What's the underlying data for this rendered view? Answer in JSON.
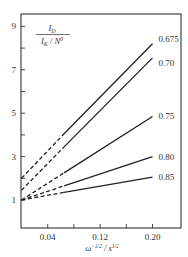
{
  "chart_data": {
    "type": "line",
    "title": "",
    "xlabel": "ω^{-1/2} / s^{1/2}",
    "xlabel_parts": {
      "base": "ω",
      "exp": "−1/2",
      "sep": " / s",
      "unit_exp": "1/2"
    },
    "ylabel": "I_D / (I_K / N^0)",
    "ylabel_parts": {
      "num": "I",
      "num_sub": "D",
      "den": "I",
      "den_sub": "K",
      "den_sep": " / N",
      "den_sup": "0"
    },
    "xlim": [
      0.0,
      0.24
    ],
    "ylim": [
      0,
      9.6
    ],
    "x_ticks": [
      0.04,
      0.08,
      0.12,
      0.16,
      0.2
    ],
    "x_tick_labels": [
      "0.04",
      "",
      "0.12",
      "",
      "0.20"
    ],
    "y_ticks": [
      1,
      2,
      3,
      4,
      5,
      6,
      7,
      8,
      9
    ],
    "y_tick_labels": [
      "1",
      "",
      "3",
      "",
      "5",
      "",
      "7",
      "",
      "9"
    ],
    "grid": false,
    "legend": "inline labels at right end of each line",
    "extrapolation_note": "dashed segments extrapolate to x = 0; solid segments are measured range",
    "series": [
      {
        "name": "0.675",
        "x": [
          0.0,
          0.065,
          0.2
        ],
        "y": [
          2.0,
          4.05,
          8.2
        ],
        "solid_from_x": 0.065
      },
      {
        "name": "0.70",
        "x": [
          0.0,
          0.065,
          0.2
        ],
        "y": [
          1.45,
          3.45,
          7.55
        ],
        "solid_from_x": 0.065
      },
      {
        "name": "0.75",
        "x": [
          0.0,
          0.065,
          0.2
        ],
        "y": [
          1.0,
          2.25,
          4.85
        ],
        "solid_from_x": 0.065
      },
      {
        "name": "0.80",
        "x": [
          0.0,
          0.065,
          0.2
        ],
        "y": [
          1.0,
          1.65,
          3.0
        ],
        "solid_from_x": 0.065
      },
      {
        "name": "0.85",
        "x": [
          0.0,
          0.065,
          0.2
        ],
        "y": [
          1.0,
          1.35,
          2.05
        ],
        "solid_from_x": 0.065
      }
    ]
  }
}
